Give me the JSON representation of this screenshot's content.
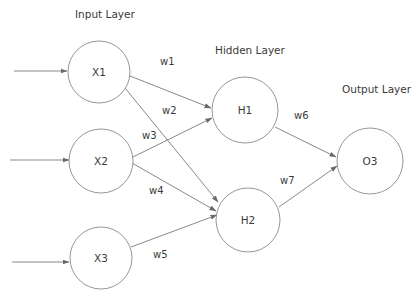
{
  "diagram": {
    "type": "neural-network",
    "colors": {
      "background": "#ffffff",
      "node_stroke": "#8a8a8a",
      "edge_stroke": "#7a7a7a",
      "text": "#3a3a3a"
    },
    "layers": {
      "input": {
        "label": "Input Layer"
      },
      "hidden": {
        "label": "Hidden Layer"
      },
      "output": {
        "label": "Output Layer"
      }
    },
    "nodes": {
      "x1": {
        "label": "X1",
        "layer": "input"
      },
      "x2": {
        "label": "X2",
        "layer": "input"
      },
      "x3": {
        "label": "X3",
        "layer": "input"
      },
      "h1": {
        "label": "H1",
        "layer": "hidden"
      },
      "h2": {
        "label": "H2",
        "layer": "hidden"
      },
      "o3": {
        "label": "O3",
        "layer": "output"
      }
    },
    "edges": [
      {
        "from": "X1",
        "to": "H1",
        "weight": "w1"
      },
      {
        "from": "X1",
        "to": "H2",
        "weight": "w2"
      },
      {
        "from": "X2",
        "to": "H1",
        "weight": "w3"
      },
      {
        "from": "X2",
        "to": "H2",
        "weight": "w4"
      },
      {
        "from": "X3",
        "to": "H2",
        "weight": "w5"
      },
      {
        "from": "H1",
        "to": "O3",
        "weight": "w6"
      },
      {
        "from": "H2",
        "to": "O3",
        "weight": "w7"
      }
    ],
    "weights": {
      "w1": "w1",
      "w2": "w2",
      "w3": "w3",
      "w4": "w4",
      "w5": "w5",
      "w6": "w6",
      "w7": "w7"
    },
    "inputs": [
      {
        "to": "X1"
      },
      {
        "to": "X2"
      },
      {
        "to": "X3"
      }
    ]
  }
}
